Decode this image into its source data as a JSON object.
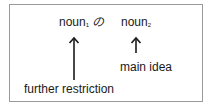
{
  "diagram": {
    "top_row": {
      "noun1": {
        "text": "noun",
        "subscript": "1"
      },
      "particle": "の",
      "noun2": {
        "text": "noun",
        "subscript": "2"
      }
    },
    "labels": {
      "further_restriction": "further restriction",
      "main_idea": "main idea"
    },
    "arrows": [
      {
        "from": "further_restriction",
        "to": "noun1",
        "direction": "up"
      },
      {
        "from": "main_idea",
        "to": "noun2",
        "direction": "up"
      }
    ],
    "colors": {
      "border": "#9a9a9a",
      "text": "#1a1a1a"
    }
  }
}
